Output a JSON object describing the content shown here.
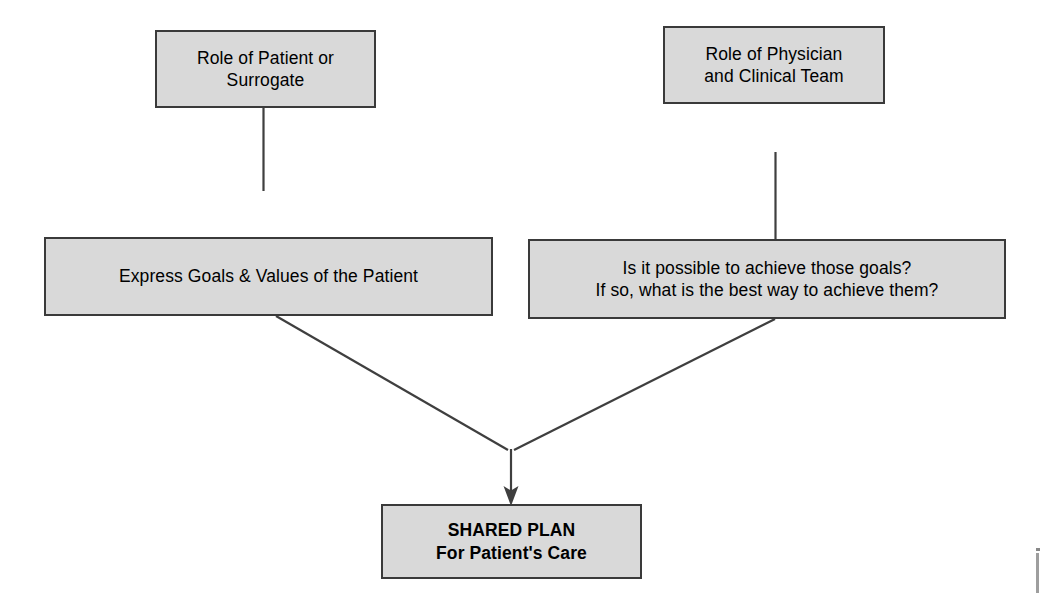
{
  "diagram": {
    "title": "Shared Plan for Patient's Care",
    "type": "flowchart",
    "background_color": "#ffffff",
    "node_fill_color": "#d9d9d9",
    "node_border_color": "#3a3a3a",
    "connector_color": "#3f3f3f",
    "nodes": [
      {
        "id": "patient-role",
        "label": "Role of Patient or\nSurrogate",
        "column": "left",
        "row": "top"
      },
      {
        "id": "physician-role",
        "label": "Role of Physician\nand Clinical Team",
        "column": "right",
        "row": "top"
      },
      {
        "id": "express-goals",
        "label": "Express Goals & Values of the Patient",
        "column": "left",
        "row": "middle"
      },
      {
        "id": "achieve-goals",
        "label": "Is it possible to achieve those goals?\nIf so, what is the best way to achieve them?",
        "column": "right",
        "row": "middle"
      },
      {
        "id": "shared-plan",
        "label": "SHARED PLAN\nFor Patient's Care",
        "column": "center",
        "row": "bottom"
      }
    ],
    "connectors": [
      {
        "id": "patient-role-to-express-goals",
        "from": "patient-role",
        "to": "express-goals",
        "style": "vertical-line",
        "arrowhead": false
      },
      {
        "id": "physician-role-to-achieve-goals",
        "from": "physician-role",
        "to": "achieve-goals",
        "style": "vertical-line",
        "arrowhead": false
      },
      {
        "id": "express-goals-to-shared-plan",
        "from": "express-goals",
        "to": "shared-plan",
        "style": "diagonal-merge",
        "arrowhead": false
      },
      {
        "id": "achieve-goals-to-shared-plan",
        "from": "achieve-goals",
        "to": "shared-plan",
        "style": "diagonal-merge",
        "arrowhead": false
      },
      {
        "id": "merge-to-shared-plan",
        "from": "merge-junction",
        "to": "shared-plan",
        "style": "vertical-line",
        "arrowhead": true
      }
    ]
  }
}
